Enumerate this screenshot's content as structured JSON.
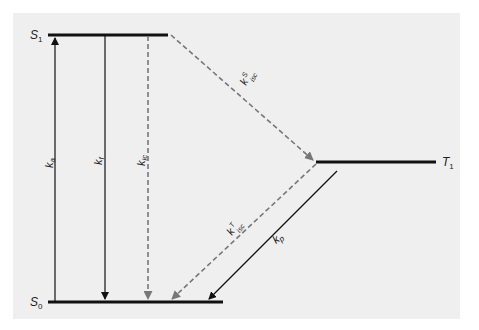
{
  "diagram": {
    "colors": {
      "background": "#ffffff",
      "panel": "#efefef",
      "solid": "#111111",
      "dashed": "#777777"
    },
    "levels": [
      {
        "id": "S1",
        "label": "S",
        "sub": "1"
      },
      {
        "id": "S0",
        "label": "S",
        "sub": "0"
      },
      {
        "id": "T1",
        "label": "T",
        "sub": "1"
      }
    ],
    "transitions": [
      {
        "id": "ka",
        "label": "k",
        "sub": "a",
        "sup": "",
        "style": "solid",
        "from": "S0",
        "to": "S1"
      },
      {
        "id": "kf",
        "label": "k",
        "sub": "f",
        "sup": "",
        "style": "solid",
        "from": "S1",
        "to": "S0"
      },
      {
        "id": "kic",
        "label": "k",
        "sub": "ic",
        "sup": "",
        "style": "dashed",
        "from": "S1",
        "to": "S0"
      },
      {
        "id": "kiscS",
        "label": "k",
        "sub": "isc",
        "sup": "S",
        "style": "dashed",
        "from": "S1",
        "to": "T1"
      },
      {
        "id": "kiscT",
        "label": "k",
        "sub": "isc",
        "sup": "T",
        "style": "dashed",
        "from": "T1",
        "to": "S0"
      },
      {
        "id": "kp",
        "label": "k",
        "sub": "p",
        "sup": "",
        "style": "solid",
        "from": "T1",
        "to": "S0"
      }
    ]
  }
}
